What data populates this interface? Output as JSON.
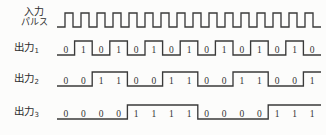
{
  "figure": {
    "type": "digital-timing-diagram",
    "background_color": "#fcfcfb",
    "line_color": "#3a3a3a",
    "text_color": "#333333"
  },
  "labels": {
    "pulse_line1": "入力",
    "pulse_line2": "パルス",
    "out1": "出力",
    "out1_sub": "1",
    "out2": "出力",
    "out2_sub": "2",
    "out3": "出力",
    "out3_sub": "3"
  },
  "chart_data": {
    "type": "line",
    "title": "",
    "xlabel": "",
    "ylabel": "",
    "grid": false,
    "legend": "none",
    "bit_count": 15,
    "wave_start_x": 57,
    "wave_end_x": 321,
    "series": [
      {
        "name": "入力パルス",
        "kind": "clock",
        "pulses": 16,
        "row_top_y": 13,
        "row_bottom_y": 27,
        "values": [
          0,
          1,
          0,
          1,
          0,
          1,
          0,
          1,
          0,
          1,
          0,
          1,
          0,
          1,
          0,
          1,
          0,
          1,
          0,
          1,
          0,
          1,
          0,
          1,
          0,
          1,
          0,
          1,
          0,
          1,
          0,
          1,
          0
        ],
        "show_digits": false
      },
      {
        "name": "出力1",
        "kind": "divide-by-2",
        "row_top_y": 41,
        "row_bottom_y": 55,
        "values": [
          0,
          1,
          0,
          1,
          0,
          1,
          0,
          1,
          0,
          1,
          0,
          1,
          0,
          1,
          0
        ],
        "show_digits": true
      },
      {
        "name": "出力2",
        "kind": "divide-by-4",
        "row_top_y": 72,
        "row_bottom_y": 86,
        "values": [
          0,
          0,
          1,
          1,
          0,
          0,
          1,
          1,
          0,
          0,
          1,
          1,
          0,
          0,
          1
        ],
        "show_digits": true
      },
      {
        "name": "出力3",
        "kind": "divide-by-8",
        "row_top_y": 105,
        "row_bottom_y": 119,
        "values": [
          0,
          0,
          0,
          0,
          1,
          1,
          1,
          1,
          0,
          0,
          0,
          0,
          1,
          1,
          1
        ],
        "show_digits": true
      }
    ]
  }
}
